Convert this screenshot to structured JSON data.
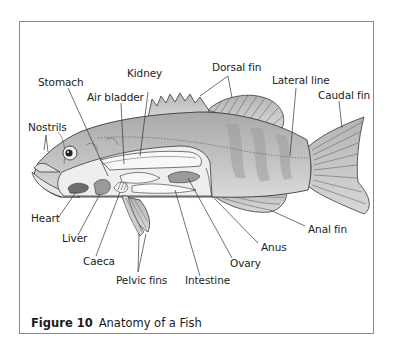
{
  "figure": {
    "number_label": "Figure 10",
    "title": "Anatomy of a Fish"
  },
  "labels": {
    "stomach": "Stomach",
    "kidney": "Kidney",
    "air_bladder": "Air bladder",
    "dorsal_fin": "Dorsal fin",
    "lateral_line": "Lateral line",
    "caudal_fin": "Caudal fin",
    "nostrils": "Nostrils",
    "heart": "Heart",
    "liver": "Liver",
    "caeca": "Caeca",
    "pelvic_fins": "Pelvic fins",
    "intestine": "Intestine",
    "ovary": "Ovary",
    "anus": "Anus",
    "anal_fin": "Anal fin"
  },
  "colors": {
    "frame": "#8a8a8a",
    "body_fill": "#bdbdbd",
    "body_band": "#9e9e9e",
    "cavity": "#e6e6e6",
    "organ_dark": "#7a7a7a",
    "organ_mid": "#a8a8a8",
    "outline": "#3a3a3a",
    "leader": "#333333"
  }
}
